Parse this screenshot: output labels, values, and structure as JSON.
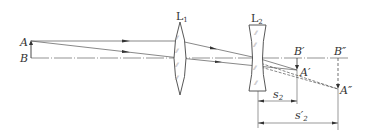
{
  "diagram": {
    "type": "optical-ray-diagram",
    "colors": {
      "line": "#555555",
      "lens_outline": "#444444",
      "background": "#ffffff"
    },
    "labels": {
      "object_top": "A",
      "object_base": "B",
      "lens1": "L",
      "lens1_sub": "1",
      "lens2": "L",
      "lens2_sub": "2",
      "intermediate_image_base": "B′",
      "intermediate_image_top": "A′",
      "final_image_base": "B″",
      "final_image_top": "A″",
      "dim_object_distance": "s",
      "dim_object_distance_sub": "2",
      "dim_image_distance": "s′",
      "dim_image_distance_sub": "2"
    },
    "elements": {
      "object": {
        "name": "AB",
        "x": 31,
        "top_y": 41,
        "base_y": 58
      },
      "lens1": {
        "name": "L1",
        "kind": "converging",
        "x": 180
      },
      "lens2": {
        "name": "L2",
        "kind": "diverging",
        "x": 257
      },
      "intermediate_image": {
        "name": "A'B'",
        "x": 297
      },
      "final_image": {
        "name": "A''B''",
        "x": 338
      },
      "dimensions": [
        {
          "label": "s2",
          "from": "L2",
          "to": "A'B'"
        },
        {
          "label": "s2'",
          "from": "L2",
          "to": "A''B''"
        }
      ]
    }
  }
}
